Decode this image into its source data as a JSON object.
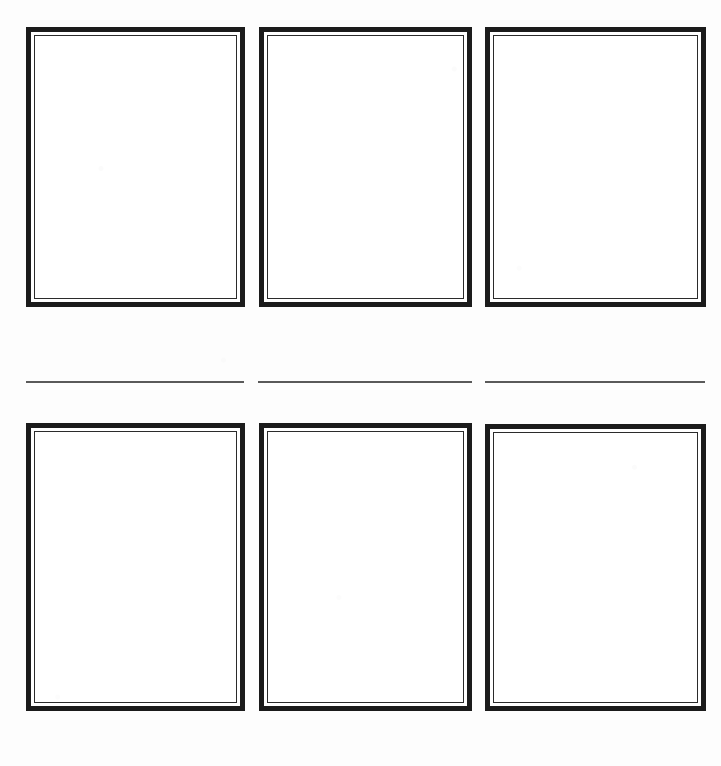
{
  "page": {
    "background_color": "#fdfdfd",
    "width": 721,
    "height": 766
  },
  "style": {
    "frame_border_color": "#1b1b1b",
    "frame_inner_line_color": "#2b2b2b",
    "frame_fill_color": "#ffffff",
    "rule_color": "#5a5a5a",
    "outer_border_width": 5,
    "inner_gap_width": 3,
    "inner_line_width": 1
  },
  "grid": {
    "columns": 3,
    "rows": 2,
    "column_x": [
      26,
      259,
      485
    ],
    "column_width": 219,
    "row_top_y": 27,
    "row_top_height": 280,
    "row_bottom_y": 423,
    "row_bottom_height": 288
  },
  "frames": [
    {
      "id": "frame-r1c1",
      "label": "",
      "content": "",
      "row": 1,
      "column": 1,
      "x": 26,
      "y": 27,
      "width": 219,
      "height": 280
    },
    {
      "id": "frame-r1c2",
      "label": "",
      "content": "",
      "row": 1,
      "column": 2,
      "x": 259,
      "y": 27,
      "width": 213,
      "height": 280
    },
    {
      "id": "frame-r1c3",
      "label": "",
      "content": "",
      "row": 1,
      "column": 3,
      "x": 485,
      "y": 27,
      "width": 221,
      "height": 280
    },
    {
      "id": "frame-r2c1",
      "label": "",
      "content": "",
      "row": 2,
      "column": 1,
      "x": 26,
      "y": 423,
      "width": 219,
      "height": 288
    },
    {
      "id": "frame-r2c2",
      "label": "",
      "content": "",
      "row": 2,
      "column": 2,
      "x": 259,
      "y": 423,
      "width": 213,
      "height": 288
    },
    {
      "id": "frame-r2c3",
      "label": "",
      "content": "",
      "row": 2,
      "column": 3,
      "x": 485,
      "y": 424,
      "width": 221,
      "height": 287
    }
  ],
  "rules": [
    {
      "id": "rule-col1",
      "column": 1,
      "x": 26,
      "y": 381,
      "width": 218,
      "thickness": 2
    },
    {
      "id": "rule-col2",
      "column": 2,
      "x": 258,
      "y": 381,
      "width": 214,
      "thickness": 2
    },
    {
      "id": "rule-col3",
      "column": 3,
      "x": 485,
      "y": 381,
      "width": 220,
      "thickness": 2
    }
  ]
}
